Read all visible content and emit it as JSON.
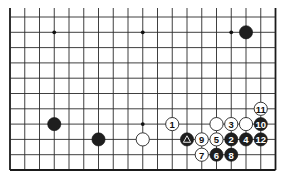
{
  "diagram": {
    "colors": {
      "line": "#2a2a2a",
      "black_stone": "#1e1e1e",
      "white_stone": "#ffffff",
      "background": "#ffffff"
    },
    "grid": {
      "columns": 19,
      "visible_rows": 11,
      "origin_x": 10,
      "origin_y": 17,
      "col_spacing": 14.75,
      "row_spacing": 15.3,
      "top_overhang": 9,
      "edges": [
        "left",
        "right",
        "bottom"
      ]
    },
    "star_points": [
      {
        "col": 3,
        "row": 1
      },
      {
        "col": 9,
        "row": 1
      },
      {
        "col": 15,
        "row": 1
      },
      {
        "col": 9,
        "row": 7
      }
    ],
    "stones": [
      {
        "color": "black",
        "col": 16,
        "row": 1,
        "label": ""
      },
      {
        "color": "black",
        "col": 3,
        "row": 7,
        "label": ""
      },
      {
        "color": "black",
        "col": 6,
        "row": 8,
        "label": ""
      },
      {
        "color": "white",
        "col": 9,
        "row": 8,
        "label": ""
      },
      {
        "color": "white",
        "col": 11,
        "row": 7,
        "label": "1"
      },
      {
        "color": "black",
        "col": 12,
        "row": 8,
        "label": "",
        "marker": "triangle"
      },
      {
        "color": "black",
        "col": 15,
        "row": 8,
        "label": "2"
      },
      {
        "color": "white",
        "col": 15,
        "row": 7,
        "label": "3"
      },
      {
        "color": "black",
        "col": 16,
        "row": 8,
        "label": "4"
      },
      {
        "color": "white",
        "col": 14,
        "row": 8,
        "label": "5"
      },
      {
        "color": "black",
        "col": 14,
        "row": 9,
        "label": "6"
      },
      {
        "color": "white",
        "col": 13,
        "row": 9,
        "label": "7"
      },
      {
        "color": "black",
        "col": 15,
        "row": 9,
        "label": "8"
      },
      {
        "color": "white",
        "col": 13,
        "row": 8,
        "label": "9"
      },
      {
        "color": "black",
        "col": 17,
        "row": 7,
        "label": "10"
      },
      {
        "color": "white",
        "col": 17,
        "row": 6,
        "label": "11"
      },
      {
        "color": "black",
        "col": 17,
        "row": 8,
        "label": "12"
      },
      {
        "color": "white",
        "col": 14,
        "row": 7,
        "label": ""
      },
      {
        "color": "white",
        "col": 16,
        "row": 7,
        "label": ""
      }
    ],
    "stone_radius": 6.6
  }
}
